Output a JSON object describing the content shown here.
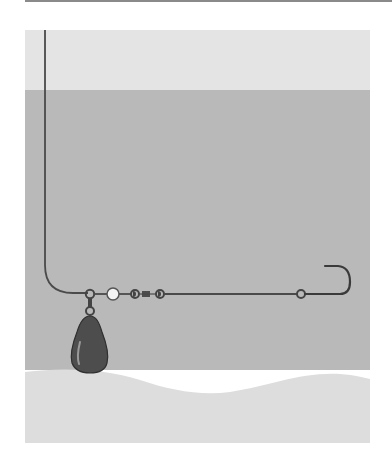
{
  "diagram": {
    "title": "",
    "colors": {
      "air": "#e4e4e4",
      "water": "#b9b9b9",
      "bottom": "#dddddd",
      "line": "#4a4a4a",
      "sinker": "#4d4d4d",
      "bead": "#f2f2f2",
      "top_rule": "#8a8a8a"
    },
    "components": [
      {
        "name": "main-line"
      },
      {
        "name": "snap-ring"
      },
      {
        "name": "sinker"
      },
      {
        "name": "bead"
      },
      {
        "name": "barrel-swivel"
      },
      {
        "name": "leader"
      },
      {
        "name": "leader-knot"
      },
      {
        "name": "hook"
      }
    ]
  }
}
